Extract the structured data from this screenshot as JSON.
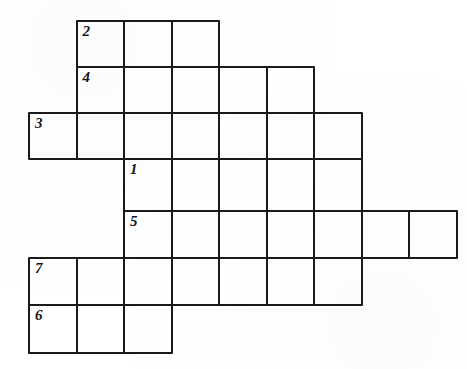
{
  "puzzle": {
    "type": "crossword-grid",
    "title": "Crossword puzzle grid",
    "geometry": {
      "cell_size": 47.5,
      "origin_x": 28,
      "origin_y": 20,
      "columns": 9,
      "rows": 7,
      "row_tops": [
        20,
        66,
        112,
        158,
        210,
        257,
        304
      ],
      "col_lefts": [
        28,
        75.5,
        123,
        170.5,
        218,
        265.5,
        313,
        360.5,
        408
      ]
    },
    "colors": {
      "grid_line": "#1a1a1a",
      "cell_fill": "#ffffff",
      "page_background": "#ffffff",
      "number_text": "#151515"
    },
    "rows": [
      {
        "row": 0,
        "col_start": 1,
        "col_end": 3,
        "cell_count": 3
      },
      {
        "row": 1,
        "col_start": 1,
        "col_end": 5,
        "cell_count": 5
      },
      {
        "row": 2,
        "col_start": 0,
        "col_end": 6,
        "cell_count": 7
      },
      {
        "row": 3,
        "col_start": 2,
        "col_end": 6,
        "cell_count": 5
      },
      {
        "row": 4,
        "col_start": 2,
        "col_end": 8,
        "cell_count": 7
      },
      {
        "row": 5,
        "col_start": 0,
        "col_end": 6,
        "cell_count": 7
      },
      {
        "row": 6,
        "col_start": 0,
        "col_end": 2,
        "cell_count": 3
      }
    ],
    "cells": [
      {
        "row": 0,
        "col": 1,
        "number": "2"
      },
      {
        "row": 0,
        "col": 2,
        "number": ""
      },
      {
        "row": 0,
        "col": 3,
        "number": ""
      },
      {
        "row": 1,
        "col": 1,
        "number": "4"
      },
      {
        "row": 1,
        "col": 2,
        "number": ""
      },
      {
        "row": 1,
        "col": 3,
        "number": ""
      },
      {
        "row": 1,
        "col": 4,
        "number": ""
      },
      {
        "row": 1,
        "col": 5,
        "number": ""
      },
      {
        "row": 2,
        "col": 0,
        "number": "3"
      },
      {
        "row": 2,
        "col": 1,
        "number": ""
      },
      {
        "row": 2,
        "col": 2,
        "number": ""
      },
      {
        "row": 2,
        "col": 3,
        "number": ""
      },
      {
        "row": 2,
        "col": 4,
        "number": ""
      },
      {
        "row": 2,
        "col": 5,
        "number": ""
      },
      {
        "row": 2,
        "col": 6,
        "number": ""
      },
      {
        "row": 3,
        "col": 2,
        "number": "1"
      },
      {
        "row": 3,
        "col": 3,
        "number": ""
      },
      {
        "row": 3,
        "col": 4,
        "number": ""
      },
      {
        "row": 3,
        "col": 5,
        "number": ""
      },
      {
        "row": 3,
        "col": 6,
        "number": ""
      },
      {
        "row": 4,
        "col": 2,
        "number": "5"
      },
      {
        "row": 4,
        "col": 3,
        "number": ""
      },
      {
        "row": 4,
        "col": 4,
        "number": ""
      },
      {
        "row": 4,
        "col": 5,
        "number": ""
      },
      {
        "row": 4,
        "col": 6,
        "number": ""
      },
      {
        "row": 4,
        "col": 7,
        "number": ""
      },
      {
        "row": 4,
        "col": 8,
        "number": ""
      },
      {
        "row": 5,
        "col": 0,
        "number": "7"
      },
      {
        "row": 5,
        "col": 1,
        "number": ""
      },
      {
        "row": 5,
        "col": 2,
        "number": ""
      },
      {
        "row": 5,
        "col": 3,
        "number": ""
      },
      {
        "row": 5,
        "col": 4,
        "number": ""
      },
      {
        "row": 5,
        "col": 5,
        "number": ""
      },
      {
        "row": 5,
        "col": 6,
        "number": ""
      },
      {
        "row": 6,
        "col": 0,
        "number": "6"
      },
      {
        "row": 6,
        "col": 1,
        "number": ""
      },
      {
        "row": 6,
        "col": 2,
        "number": ""
      }
    ],
    "clue_numbers": [
      "1",
      "2",
      "3",
      "4",
      "5",
      "6",
      "7"
    ]
  }
}
